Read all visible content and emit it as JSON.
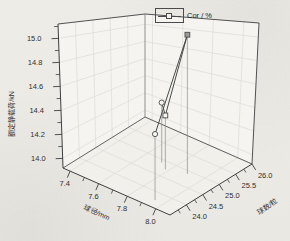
{
  "chart_data": {
    "type": "scatter",
    "projection": "3d",
    "title": "",
    "legend": {
      "label": "Cor / %",
      "position": "top-center"
    },
    "x": {
      "label": "球径/mm",
      "ticks": [
        "7.4",
        "7.6",
        "7.8",
        "8.0"
      ],
      "minor_ticks": [
        7.5,
        7.7,
        7.9
      ],
      "range": [
        7.35,
        8.1
      ]
    },
    "y": {
      "label": "球数/粒",
      "ticks": [
        "24.0",
        "24.5",
        "25.0",
        "25.5",
        "26.0"
      ],
      "minor_ticks": [
        23.75,
        24.25,
        24.75,
        25.25,
        25.75
      ],
      "range": [
        23.5,
        26.0
      ]
    },
    "z": {
      "label": "额定静载荷/kN",
      "ticks": [
        "14.0",
        "14.2",
        "14.4",
        "14.6",
        "14.8",
        "15.0"
      ],
      "minor_ticks": [
        14.1,
        14.3,
        14.5,
        14.7,
        14.9,
        15.1
      ],
      "range": [
        13.92,
        15.12
      ]
    },
    "grid": true,
    "series": [
      {
        "name": "Cor / %",
        "line": true,
        "drop_lines": true,
        "points": [
          {
            "x": 7.72,
            "y": 24.9,
            "z": 14.42,
            "marker": "circle",
            "filled": false
          },
          {
            "x": 7.78,
            "y": 24.75,
            "z": 14.37,
            "marker": "square",
            "filled": false
          },
          {
            "x": 7.9,
            "y": 24.9,
            "z": 15.08,
            "marker": "square",
            "filled": true
          },
          {
            "x": 7.94,
            "y": 23.74,
            "z": 14.47,
            "marker": "circle",
            "filled": false
          }
        ]
      }
    ],
    "colors": {
      "axis": "#3f3f3f",
      "grid": "#d9d7d2",
      "line": "#4a4a4a",
      "marker_stroke": "#4a4a4a",
      "marker_fill_open": "#f5f4ef",
      "marker_fill_solid": "#9a9a9a",
      "drop_line": "#8c8c8c",
      "wall": "#f5f4f0",
      "floor": "#f1f0ea",
      "background": "#edebe6",
      "text": "#2f2f2f"
    }
  }
}
